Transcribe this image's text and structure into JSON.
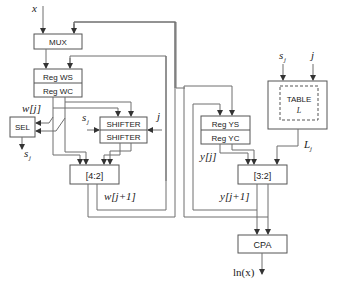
{
  "diagram": {
    "blocks": {
      "mux": "MUX",
      "reg_ws": "Reg WS",
      "reg_wc": "Reg WC",
      "sel": "SEL",
      "shifter_top": "SHIFTER",
      "shifter_bottom": "SHIFTER",
      "csa42": "[4:2]",
      "reg_ys": "Reg YS",
      "reg_yc": "Reg YC",
      "table_title": "TABLE",
      "table_sub": "L",
      "csa32": "[3:2]",
      "cpa": "CPA"
    },
    "signals": {
      "x_input": "x",
      "w_j": "w[j]",
      "s_j_sel_out": "s",
      "s_j_sel_out_sub": "j",
      "s_j_shifter": "s",
      "s_j_shifter_sub": "j",
      "j_shifter": "j",
      "w_j1": "w[j+1]",
      "s_j_table": "s",
      "s_j_table_sub": "j",
      "j_table": "j",
      "L_j": "L",
      "L_j_sub": "j",
      "y_j": "y[j]",
      "y_j1": "y[j+1]",
      "output_ln_x": "ln(x)"
    },
    "colors": {
      "wire": "#6e6e6e",
      "box_stroke": "#555555",
      "text": "#222222",
      "background": "#ffffff"
    }
  }
}
